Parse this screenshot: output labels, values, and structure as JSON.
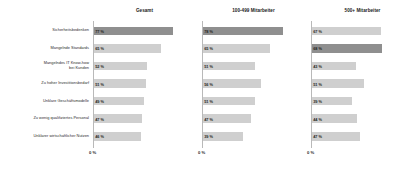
{
  "chart_data": {
    "type": "bar",
    "orientation": "horizontal",
    "title": "",
    "xlabel": "",
    "ylabel": "",
    "xlim": [
      0,
      100
    ],
    "grid": false,
    "legend": "none",
    "axis_origin_label": "0 %",
    "value_suffix": " %",
    "categories": [
      "Sicherheitsbedenken",
      "Mangelnde Standards",
      "Mangelndes IT Know-how bei Kunden",
      "Zu hoher Investitionsbedarf",
      "Unklare Geschäftsmodelle",
      "Zu wenig qualifiziertes Personal",
      "Unklarer wirtschaftlicher Nutzen"
    ],
    "category_lines": [
      [
        "Sicherheitsbedenken"
      ],
      [
        "Mangelnde Standards"
      ],
      [
        "Mangelndes IT Know-how",
        "bei Kunden"
      ],
      [
        "Zu hoher Investitionsbedarf"
      ],
      [
        "Unklare Geschäftsmodelle"
      ],
      [
        "Zu wenig qualifiziertes Personal"
      ],
      [
        "Unklarer wirtschaftlicher Nutzen"
      ]
    ],
    "series": [
      {
        "name": "Gesamt",
        "values": [
          77,
          65,
          52,
          51,
          49,
          47,
          46
        ],
        "labels": [
          "77 %",
          "65 %",
          "52 %",
          "51 %",
          "49 %",
          "47 %",
          "46 %"
        ],
        "highlight_index": 0
      },
      {
        "name": "100-499 Mitarbeiter",
        "values": [
          78,
          65,
          51,
          56,
          51,
          47,
          39
        ],
        "labels": [
          "78 %",
          "65 %",
          "51 %",
          "56 %",
          "51 %",
          "47 %",
          "39 %"
        ],
        "highlight_index": 0
      },
      {
        "name": "500+ Mitarbeiter",
        "values": [
          67,
          68,
          43,
          51,
          39,
          44,
          47
        ],
        "labels": [
          "67 %",
          "68 %",
          "43 %",
          "51 %",
          "39 %",
          "44 %",
          "47 %"
        ],
        "highlight_index": 1
      }
    ],
    "colors": {
      "bar": "#cfcfcf",
      "bar_highlight": "#8f8f8f",
      "text": "#1e1e1e",
      "axis": "#b9b9b9",
      "background": "#ffffff"
    }
  }
}
